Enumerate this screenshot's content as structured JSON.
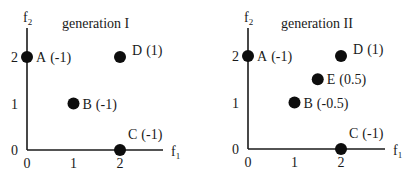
{
  "panels": [
    {
      "title": "generation I",
      "x_axis_label": "f",
      "x_axis_sub": "1",
      "y_axis_label": "f",
      "y_axis_sub": "2",
      "x_ticks": [
        "0",
        "1",
        "2"
      ],
      "y_ticks": [
        "0",
        "1",
        "2"
      ],
      "points": [
        {
          "name": "A",
          "value": "(-1)",
          "f1": 0,
          "f2": 2
        },
        {
          "name": "B",
          "value": "(-1)",
          "f1": 1,
          "f2": 1
        },
        {
          "name": "C",
          "value": "(-1)",
          "f1": 2,
          "f2": 0
        },
        {
          "name": "D",
          "value": "(1)",
          "f1": 2,
          "f2": 2
        }
      ]
    },
    {
      "title": "generation II",
      "x_axis_label": "f",
      "x_axis_sub": "1",
      "y_axis_label": "f",
      "y_axis_sub": "2",
      "x_ticks": [
        "0",
        "1",
        "2"
      ],
      "y_ticks": [
        "0",
        "1",
        "2"
      ],
      "points": [
        {
          "name": "A",
          "value": "(-1)",
          "f1": 0,
          "f2": 2
        },
        {
          "name": "B",
          "value": "(-0.5)",
          "f1": 1,
          "f2": 1
        },
        {
          "name": "C",
          "value": "(-1)",
          "f1": 2,
          "f2": 0
        },
        {
          "name": "D",
          "value": "(1)",
          "f1": 2,
          "f2": 2
        },
        {
          "name": "E",
          "value": "(0.5)",
          "f1": 1.5,
          "f2": 1.5
        }
      ]
    }
  ]
}
